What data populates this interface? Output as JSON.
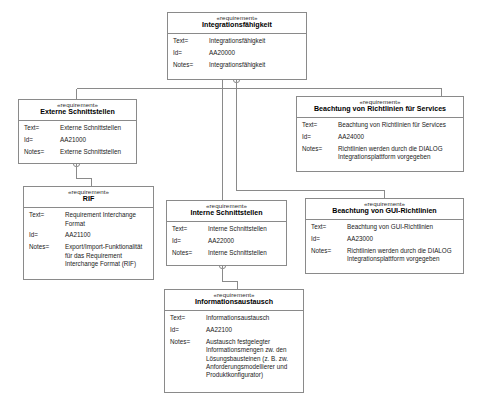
{
  "diagram": {
    "type": "uml-requirements-diagram",
    "stereotype_label": "«requirement»",
    "field_labels": {
      "text": "Text=",
      "id": "Id=",
      "notes": "Notes="
    },
    "junction_icon": "circle-cross-icon",
    "line_color": "#8a8a8a"
  },
  "nodes": [
    {
      "key": "integrationsfaehigkeit",
      "stereotype": "«requirement»",
      "title": "Integrationsfähigkeit",
      "text": "Integrationsfähigkeit",
      "id": "AA20000",
      "notes": "Integrationsfähigkeit"
    },
    {
      "key": "externe_schnittstellen",
      "stereotype": "«requirement»",
      "title": "Externe Schnittstellen",
      "text": "Externe Schnittstellen",
      "id": "AA21000",
      "notes": "Externe Schnittstellen"
    },
    {
      "key": "richtlinien_services",
      "stereotype": "«requirement»",
      "title": "Beachtung von Richtlinien für Services",
      "text": "Beachtung von Richtlinien für Services",
      "id": "AA24000",
      "notes": "Richtlinien werden durch die DIALOG\nIntegrationsplattform vorgegeben"
    },
    {
      "key": "rif",
      "stereotype": "«requirement»",
      "title": "RIF",
      "text": "Requirement Interchange\nFormat",
      "id": "AA21100",
      "notes": "Export/Import-Funktionalität\nfür das Requirement\nInterchange Format (RIF)"
    },
    {
      "key": "interne_schnittstellen",
      "stereotype": "«requirement»",
      "title": "Interne Schnittstellen",
      "text": "Interne Schnittstellen",
      "id": "AA22000",
      "notes": "Interne Schnittstellen"
    },
    {
      "key": "gui_richtlinien",
      "stereotype": "«requirement»",
      "title": "Beachtung von GUI-Richtlinien",
      "text": "Beachtung von GUI-Richtlinien",
      "id": "AA23000",
      "notes": "Richtlinien werden durch die DIALOG\nIntegrationsplattform vorgegeben"
    },
    {
      "key": "informationsaustausch",
      "stereotype": "«requirement»",
      "title": "Informationsaustausch",
      "text": "Informationsaustausch",
      "id": "AA22100",
      "notes": "Austausch festgelegter\nInformationsmengen zw. den\nLösungsbausteinen (z. B. zw.\nAnforderungsmodellierer und\nProduktkonfigurator)"
    }
  ],
  "edges": [
    {
      "from": "integrationsfaehigkeit",
      "to": "externe_schnittstellen"
    },
    {
      "from": "integrationsfaehigkeit",
      "to": "richtlinien_services"
    },
    {
      "from": "integrationsfaehigkeit",
      "to": "interne_schnittstellen"
    },
    {
      "from": "integrationsfaehigkeit",
      "to": "gui_richtlinien"
    },
    {
      "from": "externe_schnittstellen",
      "to": "rif"
    },
    {
      "from": "interne_schnittstellen",
      "to": "informationsaustausch"
    }
  ]
}
